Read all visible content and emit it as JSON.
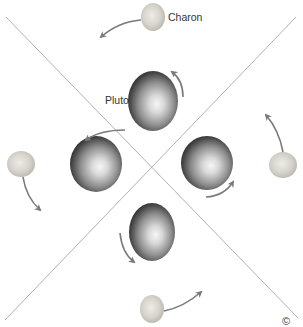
{
  "diagram": {
    "labels": {
      "charon": "Charon",
      "pluto": "Pluto"
    },
    "corner_glyph": "©",
    "colors": {
      "background": "#ffffff",
      "axis_lines": "#a8a8a8",
      "arrows": "#7a7a7a",
      "pluto_light": "#f4f4f4",
      "pluto_mid": "#9a9a9a",
      "pluto_dark": "#2e2e2e",
      "charon_light": "#e6e4df",
      "charon_mid": "#c9c6bf",
      "label_text": "#333333"
    },
    "axis_lines": [
      {
        "x1": 6,
        "y1": 17,
        "x2": 298,
        "y2": 318
      },
      {
        "x1": 296,
        "y1": 17,
        "x2": 5,
        "y2": 320
      }
    ],
    "positions": [
      {
        "name": "top",
        "pluto": {
          "cx": 153,
          "cy": 101,
          "rx": 25,
          "ry": 30
        },
        "charon": {
          "cx": 153,
          "cy": 17,
          "rx": 12,
          "ry": 14
        }
      },
      {
        "name": "left",
        "pluto": {
          "cx": 96,
          "cy": 164,
          "rx": 26,
          "ry": 28
        },
        "charon": {
          "cx": 21,
          "cy": 164,
          "rx": 14,
          "ry": 13
        }
      },
      {
        "name": "right",
        "pluto": {
          "cx": 207,
          "cy": 163,
          "rx": 26,
          "ry": 27
        },
        "charon": {
          "cx": 283,
          "cy": 165,
          "rx": 14,
          "ry": 13
        }
      },
      {
        "name": "bottom",
        "pluto": {
          "cx": 152,
          "cy": 232,
          "rx": 23,
          "ry": 29
        },
        "charon": {
          "cx": 152,
          "cy": 309,
          "rx": 12,
          "ry": 14
        }
      }
    ]
  }
}
